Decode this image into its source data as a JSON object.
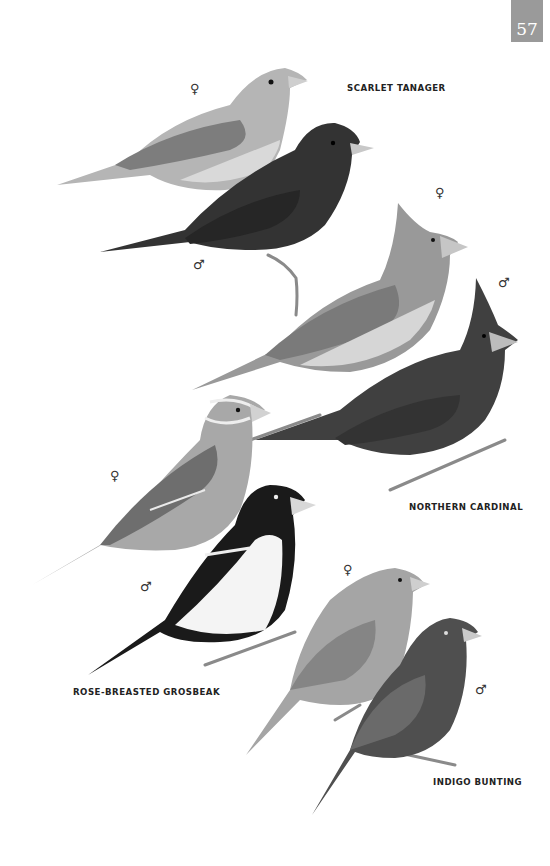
{
  "page": {
    "number": "57"
  },
  "species": [
    {
      "name": "SCARLET TANAGER",
      "label_pos": [
        347,
        82
      ],
      "birds": [
        {
          "sex": "♀",
          "symbol_pos": [
            190,
            82
          ],
          "tone": "#a9a9a9"
        },
        {
          "sex": "♂",
          "symbol_pos": [
            193,
            258
          ],
          "tone": "#3a3a3a"
        }
      ]
    },
    {
      "name": "NORTHERN CARDINAL",
      "label_pos": [
        409,
        501
      ],
      "birds": [
        {
          "sex": "♀",
          "symbol_pos": [
            435,
            186
          ],
          "tone": "#8f8f8f"
        },
        {
          "sex": "♂",
          "symbol_pos": [
            498,
            276
          ],
          "tone": "#454545"
        }
      ]
    },
    {
      "name": "ROSE-BREASTED GROSBEAK",
      "label_pos": [
        73,
        686
      ],
      "birds": [
        {
          "sex": "♀",
          "symbol_pos": [
            110,
            469
          ],
          "tone": "#9c9c9c"
        },
        {
          "sex": "♂",
          "symbol_pos": [
            140,
            580
          ],
          "tone": "#1e1e1e"
        }
      ]
    },
    {
      "name": "INDIGO BUNTING",
      "label_pos": [
        433,
        776
      ],
      "birds": [
        {
          "sex": "♀",
          "symbol_pos": [
            343,
            563
          ],
          "tone": "#9a9a9a"
        },
        {
          "sex": "♂",
          "symbol_pos": [
            475,
            683
          ],
          "tone": "#4a4a4a"
        }
      ]
    }
  ],
  "colors": {
    "page_tab": "#9a9a9a",
    "text": "#222222",
    "background": "#ffffff"
  }
}
